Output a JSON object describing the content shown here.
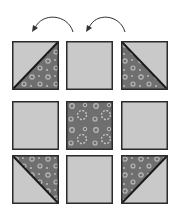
{
  "diagram": {
    "title": "",
    "colors": {
      "light_fabric": "#c9c9c9",
      "dark_fabric": "#6f6f6f",
      "print_dots": "#bdbdbd",
      "outline": "#2b2b2b",
      "arrow": "#333333"
    },
    "arrows": [
      {
        "id": "arrow-1",
        "from": "top-middle",
        "to": "top-left",
        "direction": "counter-clockwise"
      },
      {
        "id": "arrow-2",
        "from": "top-right",
        "to": "top-middle",
        "direction": "counter-clockwise"
      }
    ],
    "grid": {
      "rows": 3,
      "cols": 3,
      "blocks": [
        {
          "row": 0,
          "col": 0,
          "type": "half-square-triangle",
          "dark_corner": "bottom-right"
        },
        {
          "row": 0,
          "col": 1,
          "type": "solid-light"
        },
        {
          "row": 0,
          "col": 2,
          "type": "half-square-triangle",
          "dark_corner": "bottom-left"
        },
        {
          "row": 1,
          "col": 0,
          "type": "solid-light"
        },
        {
          "row": 1,
          "col": 1,
          "type": "solid-print-dark"
        },
        {
          "row": 1,
          "col": 2,
          "type": "solid-light"
        },
        {
          "row": 2,
          "col": 0,
          "type": "half-square-triangle",
          "dark_corner": "top-right"
        },
        {
          "row": 2,
          "col": 1,
          "type": "solid-light"
        },
        {
          "row": 2,
          "col": 2,
          "type": "half-square-triangle",
          "dark_corner": "top-left"
        }
      ]
    }
  }
}
